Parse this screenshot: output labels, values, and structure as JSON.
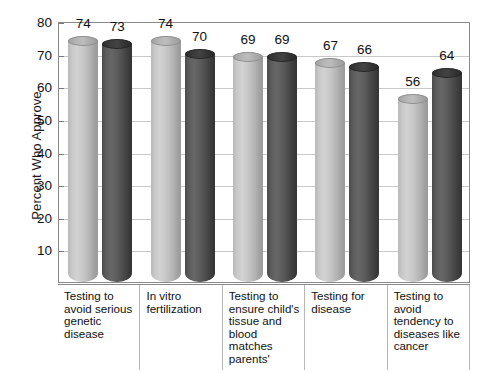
{
  "chart_data": {
    "type": "bar",
    "title": "",
    "subtitle": "",
    "xlabel": "",
    "ylabel": "Percent Who Approve",
    "ylim": [
      0,
      80
    ],
    "ytick_interval": 10,
    "yticks": [
      80,
      70,
      60,
      50,
      40,
      30,
      20,
      10
    ],
    "grid": true,
    "legend": "none",
    "style_note": "3D cylinder bars, two series per category (light gray and dark gray)",
    "colors": {
      "series_light": "#c2c2c2",
      "series_dark": "#4f4f4f",
      "gridline": "#c9c9c9",
      "frame": "#8a8a8a",
      "text": "#111111",
      "background": "#ffffff"
    },
    "categories": [
      "Testing to avoid serious genetic disease",
      "In vitro fertilization",
      "Testing to ensure child's tissue and blood matches parents'",
      "Testing for disease",
      "Testing to avoid tendency to diseases like cancer"
    ],
    "series": [
      {
        "name": "series-1",
        "shade": "light",
        "values": [
          74,
          74,
          69,
          67,
          56
        ]
      },
      {
        "name": "series-2",
        "shade": "dark",
        "values": [
          73,
          70,
          69,
          66,
          64
        ]
      }
    ],
    "bars": [
      {
        "category_index": 0,
        "series_index": 0,
        "shade": "light",
        "value": 74
      },
      {
        "category_index": 0,
        "series_index": 1,
        "shade": "dark",
        "value": 73
      },
      {
        "category_index": 1,
        "series_index": 0,
        "shade": "light",
        "value": 74
      },
      {
        "category_index": 1,
        "series_index": 1,
        "shade": "dark",
        "value": 70
      },
      {
        "category_index": 2,
        "series_index": 0,
        "shade": "light",
        "value": 69
      },
      {
        "category_index": 2,
        "series_index": 1,
        "shade": "dark",
        "value": 69
      },
      {
        "category_index": 3,
        "series_index": 0,
        "shade": "light",
        "value": 67
      },
      {
        "category_index": 3,
        "series_index": 1,
        "shade": "dark",
        "value": 66
      },
      {
        "category_index": 4,
        "series_index": 0,
        "shade": "light",
        "value": 56
      },
      {
        "category_index": 4,
        "series_index": 1,
        "shade": "dark",
        "value": 64
      }
    ]
  }
}
